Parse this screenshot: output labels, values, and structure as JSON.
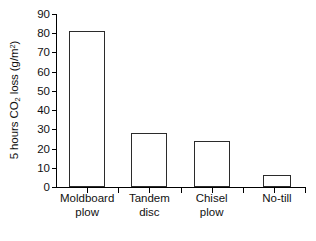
{
  "chart_data": {
    "type": "bar",
    "title": "",
    "xlabel": "",
    "ylabel": "5 hours CO2 loss (g/m2)",
    "ylabel_parts": {
      "pre": "5 hours CO",
      "sub": "2",
      "mid": " loss (g/m",
      "sup": "2",
      "post": ")"
    },
    "categories": [
      "Moldboard plow",
      "Tandem disc",
      "Chisel plow",
      "No-till"
    ],
    "category_lines": [
      [
        "Moldboard",
        "plow"
      ],
      [
        "Tandem",
        "disc"
      ],
      [
        "Chisel",
        "plow"
      ],
      [
        "No-till",
        ""
      ]
    ],
    "values": [
      81,
      28,
      24,
      6.5
    ],
    "ylim": [
      0,
      90
    ],
    "ytick_values": [
      0,
      10,
      20,
      30,
      40,
      50,
      60,
      70,
      80,
      90
    ],
    "ytick_labels": [
      "0",
      "10",
      "20",
      "30",
      "40",
      "50",
      "60",
      "70",
      "80",
      "90"
    ],
    "grid": false,
    "legend": false,
    "bar_facecolor": "#ffffff",
    "bar_edgecolor": "#2b2b2b",
    "axis_color": "#000000",
    "text_color": "#111111"
  },
  "caption": {
    "text": ""
  }
}
